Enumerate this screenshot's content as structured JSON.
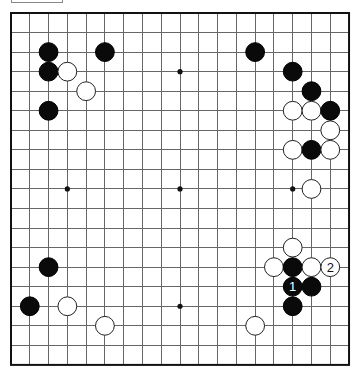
{
  "diagram": {
    "title": "",
    "board_size": 19,
    "geometry": {
      "origin_x": 11,
      "origin_y": 13,
      "cell_w": 18.78,
      "cell_h": 19.55,
      "stone_radius": 9.4,
      "star_radius": 2.6
    },
    "colors": {
      "background": "#ffffff",
      "grid": "#666666",
      "border": "#111111",
      "black_stone": "#0a0a0a",
      "white_stone": "#ffffff"
    },
    "star_points": [
      {
        "col": 3,
        "row": 3
      },
      {
        "col": 9,
        "row": 3
      },
      {
        "col": 15,
        "row": 3
      },
      {
        "col": 3,
        "row": 9
      },
      {
        "col": 9,
        "row": 9
      },
      {
        "col": 15,
        "row": 9
      },
      {
        "col": 3,
        "row": 15
      },
      {
        "col": 9,
        "row": 15
      },
      {
        "col": 15,
        "row": 15
      }
    ],
    "stones": [
      {
        "color": "black",
        "col": 2,
        "row": 2,
        "label": ""
      },
      {
        "color": "black",
        "col": 5,
        "row": 2,
        "label": ""
      },
      {
        "color": "black",
        "col": 2,
        "row": 3,
        "label": ""
      },
      {
        "color": "white",
        "col": 3,
        "row": 3,
        "label": ""
      },
      {
        "color": "white",
        "col": 4,
        "row": 4,
        "label": ""
      },
      {
        "color": "black",
        "col": 2,
        "row": 5,
        "label": ""
      },
      {
        "color": "black",
        "col": 13,
        "row": 2,
        "label": ""
      },
      {
        "color": "black",
        "col": 15,
        "row": 3,
        "label": ""
      },
      {
        "color": "black",
        "col": 16,
        "row": 4,
        "label": ""
      },
      {
        "color": "white",
        "col": 15,
        "row": 5,
        "label": ""
      },
      {
        "color": "white",
        "col": 16,
        "row": 5,
        "label": ""
      },
      {
        "color": "black",
        "col": 17,
        "row": 5,
        "label": ""
      },
      {
        "color": "white",
        "col": 17,
        "row": 6,
        "label": ""
      },
      {
        "color": "white",
        "col": 15,
        "row": 7,
        "label": ""
      },
      {
        "color": "black",
        "col": 16,
        "row": 7,
        "label": ""
      },
      {
        "color": "white",
        "col": 17,
        "row": 7,
        "label": ""
      },
      {
        "color": "white",
        "col": 16,
        "row": 9,
        "label": ""
      },
      {
        "color": "white",
        "col": 15,
        "row": 12,
        "label": ""
      },
      {
        "color": "white",
        "col": 14,
        "row": 13,
        "label": ""
      },
      {
        "color": "black",
        "col": 15,
        "row": 13,
        "label": ""
      },
      {
        "color": "white",
        "col": 16,
        "row": 13,
        "label": ""
      },
      {
        "color": "white",
        "col": 17,
        "row": 13,
        "label": "2"
      },
      {
        "color": "black",
        "col": 15,
        "row": 14,
        "label": "1"
      },
      {
        "color": "black",
        "col": 16,
        "row": 14,
        "label": ""
      },
      {
        "color": "black",
        "col": 15,
        "row": 15,
        "label": ""
      },
      {
        "color": "white",
        "col": 13,
        "row": 16,
        "label": ""
      },
      {
        "color": "black",
        "col": 2,
        "row": 13,
        "label": ""
      },
      {
        "color": "black",
        "col": 1,
        "row": 15,
        "label": ""
      },
      {
        "color": "white",
        "col": 3,
        "row": 15,
        "label": ""
      },
      {
        "color": "white",
        "col": 5,
        "row": 16,
        "label": ""
      }
    ]
  }
}
